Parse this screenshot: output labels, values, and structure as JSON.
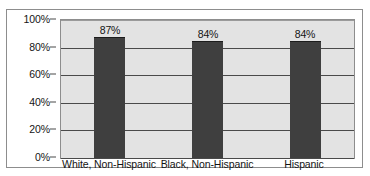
{
  "chart_data": {
    "type": "bar",
    "title": "",
    "subtitle": "",
    "xlabel": "",
    "ylabel": "",
    "categories": [
      "White, Non-Hispanic",
      "Black, Non-Hispanic",
      "Hispanic"
    ],
    "values": [
      87,
      84,
      84
    ],
    "value_labels": [
      "87%",
      "84%",
      "84%"
    ],
    "ylim": [
      0,
      100
    ],
    "ytick_labels": [
      "100%",
      "80%",
      "60%",
      "40%",
      "20%",
      "0%"
    ],
    "ytick_values": [
      100,
      80,
      60,
      40,
      20,
      0
    ],
    "grid": true,
    "legend": false,
    "legend_position": "none",
    "bar_color": "#3f3f3f",
    "plot_background": "#e3e3e3",
    "gridline_color": "#4a4a4a",
    "border_color": "#8d8d8d"
  }
}
